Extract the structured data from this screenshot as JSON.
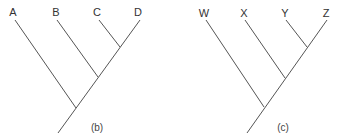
{
  "diagrams": [
    {
      "caption": "(b)",
      "caption_pos": [
        97,
        131
      ],
      "leaves": [
        {
          "label": "A",
          "label_pos": [
            13,
            16
          ],
          "tip": [
            15,
            20
          ],
          "join": [
            76,
            108
          ]
        },
        {
          "label": "B",
          "label_pos": [
            56,
            16
          ],
          "tip": [
            57,
            20
          ],
          "join": [
            98,
            77
          ]
        },
        {
          "label": "C",
          "label_pos": [
            97,
            16
          ],
          "tip": [
            99,
            20
          ],
          "join": [
            120,
            47
          ]
        },
        {
          "label": "D",
          "label_pos": [
            138,
            16
          ],
          "tip": [
            140,
            20
          ],
          "join": null
        }
      ],
      "trunk": {
        "top": [
          140,
          20
        ],
        "bottom": [
          58,
          133
        ]
      }
    },
    {
      "caption": "(c)",
      "caption_pos": [
        283,
        131
      ],
      "leaves": [
        {
          "label": "W",
          "label_pos": [
            204,
            17
          ],
          "tip": [
            206,
            20
          ],
          "join": [
            264,
            107
          ]
        },
        {
          "label": "X",
          "label_pos": [
            244,
            17
          ],
          "tip": [
            245,
            20
          ],
          "join": [
            285,
            78
          ]
        },
        {
          "label": "Y",
          "label_pos": [
            285,
            17
          ],
          "tip": [
            286,
            20
          ],
          "join": [
            307,
            47
          ]
        },
        {
          "label": "Z",
          "label_pos": [
            326,
            17
          ],
          "tip": [
            327,
            20
          ],
          "join": null
        }
      ],
      "trunk": {
        "top": [
          327,
          20
        ],
        "bottom": [
          247,
          133
        ]
      }
    }
  ]
}
